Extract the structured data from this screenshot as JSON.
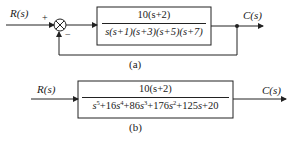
{
  "diagram_a": {
    "input_label": "R(s)",
    "output_label": "C(s)",
    "plus_sign": "+",
    "minus_sign": "−",
    "block": {
      "numerator": "10(s+2)",
      "denominator": "s(s+1)(s+3)(s+5)(s+7)"
    },
    "caption": "(a)",
    "feedback": "unity negative feedback"
  },
  "diagram_b": {
    "input_label": "R(s)",
    "output_label": "C(s)",
    "block": {
      "numerator": "10(s+2)",
      "denominator_terms": [
        {
          "coef": "",
          "var": "s",
          "exp": "5"
        },
        {
          "coef": "+16",
          "var": "s",
          "exp": "4"
        },
        {
          "coef": "+86",
          "var": "s",
          "exp": "3"
        },
        {
          "coef": "+176",
          "var": "s",
          "exp": "2"
        },
        {
          "coef": "+125",
          "var": "s",
          "exp": ""
        },
        {
          "coef": "+20",
          "var": "",
          "exp": ""
        }
      ]
    },
    "caption": "(b)"
  },
  "colors": {
    "line": "#222222",
    "background": "#ffffff"
  }
}
